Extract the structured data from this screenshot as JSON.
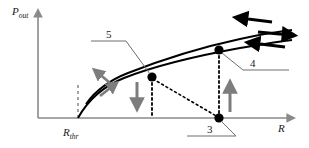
{
  "figure": {
    "background_color": "#ffffff"
  },
  "axes": {
    "y_label_main": "P",
    "y_label_sub": "out",
    "x_label_main": "R",
    "threshold_label_main": "R",
    "threshold_label_sub": "thr",
    "axis_color": "#8a8a8a",
    "y_range_note": "",
    "x_range_note": ""
  },
  "callouts": [
    {
      "id": "callout-5",
      "label": "5",
      "target": "upper-curve-point"
    },
    {
      "id": "callout-4",
      "label": "4",
      "target": "upper-branch-point"
    },
    {
      "id": "callout-3",
      "label": "3",
      "target": "axis-point"
    }
  ],
  "curves": {
    "upper_curve_name": "upper-branch-curve",
    "lower_curve_name": "lower-branch-curve",
    "curve_color": "#000000"
  },
  "markers": [
    {
      "name": "marker-point-5",
      "x": 152,
      "y": 76
    },
    {
      "name": "marker-point-4",
      "x": 219,
      "y": 50
    },
    {
      "name": "marker-point-3",
      "x": 219,
      "y": 118
    }
  ],
  "arrows": {
    "gray_color": "#7d7d7d",
    "black_color": "#000000",
    "items": [
      {
        "name": "arrow-curve-up-left",
        "direction": "up-left",
        "color": "gray"
      },
      {
        "name": "arrow-curve-up-right",
        "direction": "up-right",
        "color": "gray"
      },
      {
        "name": "arrow-down-transition",
        "direction": "down",
        "color": "gray"
      },
      {
        "name": "arrow-up-transition",
        "direction": "up",
        "color": "gray"
      },
      {
        "name": "arrow-upper-left-top",
        "direction": "left",
        "color": "black"
      },
      {
        "name": "arrow-between-curves-right",
        "direction": "right",
        "color": "black"
      },
      {
        "name": "arrow-lower-left-bottom",
        "direction": "left",
        "color": "black"
      }
    ]
  },
  "dotted_lines": {
    "color": "#000000",
    "items": [
      {
        "name": "dotted-vertical-point5"
      },
      {
        "name": "dotted-vertical-point4"
      },
      {
        "name": "dotted-diagonal-5-to-3"
      }
    ]
  }
}
